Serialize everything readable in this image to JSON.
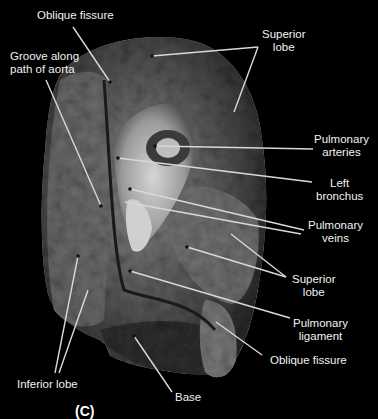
{
  "figure": {
    "partial_caption_visible": "(C)",
    "label_color": "#f2f2f2",
    "background": "#000000"
  },
  "labels": [
    {
      "id": "oblique-fissure-top",
      "lines": [
        "Oblique fissure"
      ]
    },
    {
      "id": "superior-lobe-top",
      "lines": [
        "Superior",
        "lobe"
      ]
    },
    {
      "id": "groove-aorta",
      "lines": [
        "Groove along",
        "path of aorta"
      ]
    },
    {
      "id": "pulmonary-arteries",
      "lines": [
        "Pulmonary",
        "arteries"
      ]
    },
    {
      "id": "left-bronchus",
      "lines": [
        "Left",
        "bronchus"
      ]
    },
    {
      "id": "pulmonary-veins",
      "lines": [
        "Pulmonary",
        "veins"
      ]
    },
    {
      "id": "superior-lobe-mid",
      "lines": [
        "Superior",
        "lobe"
      ]
    },
    {
      "id": "pulmonary-ligament",
      "lines": [
        "Pulmonary",
        "ligament"
      ]
    },
    {
      "id": "oblique-fissure-bottom",
      "lines": [
        "Oblique fissure"
      ]
    },
    {
      "id": "inferior-lobe",
      "lines": [
        "Inferior lobe"
      ]
    },
    {
      "id": "base",
      "lines": [
        "Base"
      ]
    }
  ]
}
